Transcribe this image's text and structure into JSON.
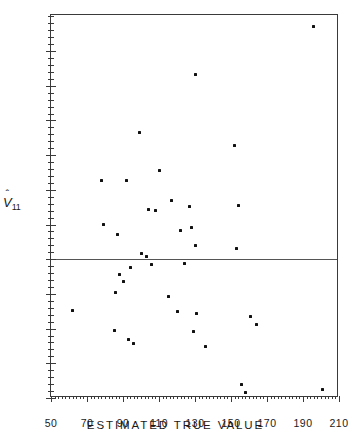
{
  "chart_data": {
    "type": "scatter",
    "title": "",
    "xlabel": "ESTIMATED TRUE VALUE",
    "ylabel": "V̀11",
    "ylabel_parts": {
      "symbol": "V",
      "accent": "ˆ",
      "subscript": "11"
    },
    "xlim": [
      50,
      210
    ],
    "ylim": [
      -10.0,
      17.6
    ],
    "xticks": [
      50,
      70,
      90,
      110,
      130,
      150,
      170,
      190,
      210
    ],
    "xtick_labels": [
      "50",
      "70",
      "90",
      "110",
      "130",
      "150",
      "170",
      "190",
      "210"
    ],
    "x_minor_step": 2,
    "yticks": [
      -10.0,
      -7.5,
      -5.0,
      -2.5,
      0,
      2.5,
      5.0,
      7.5,
      10.0,
      12.5,
      15.0
    ],
    "ytick_labels": [
      "-10.0",
      "-7.5",
      "-5.0",
      "-2.5",
      "0",
      "2.5",
      "5.0",
      "7.5",
      "10.0",
      "12.5",
      "15.0"
    ],
    "y_minor_step": 0.5,
    "grid": false,
    "legend": null,
    "reference_line": {
      "axis": "y",
      "value": 0
    },
    "marker": {
      "shape": "square",
      "color": "#111111",
      "size": 3
    },
    "points": [
      {
        "x": 62,
        "y": -3.7
      },
      {
        "x": 78,
        "y": 5.7
      },
      {
        "x": 79,
        "y": 2.5
      },
      {
        "x": 85,
        "y": -5.1
      },
      {
        "x": 86,
        "y": -2.4
      },
      {
        "x": 87,
        "y": 1.8
      },
      {
        "x": 88,
        "y": -1.1
      },
      {
        "x": 90,
        "y": -1.6
      },
      {
        "x": 92,
        "y": 5.7
      },
      {
        "x": 93,
        "y": -5.8
      },
      {
        "x": 94,
        "y": -0.6
      },
      {
        "x": 96,
        "y": -6.1
      },
      {
        "x": 99,
        "y": 9.1
      },
      {
        "x": 100,
        "y": 0.4
      },
      {
        "x": 103,
        "y": 0.2
      },
      {
        "x": 104,
        "y": 3.6
      },
      {
        "x": 106,
        "y": -0.4
      },
      {
        "x": 108,
        "y": 3.5
      },
      {
        "x": 110,
        "y": 6.4
      },
      {
        "x": 115,
        "y": -2.7
      },
      {
        "x": 117,
        "y": 4.2
      },
      {
        "x": 120,
        "y": -3.8
      },
      {
        "x": 122,
        "y": 2.1
      },
      {
        "x": 124,
        "y": -0.3
      },
      {
        "x": 127,
        "y": 3.8
      },
      {
        "x": 128,
        "y": 2.3
      },
      {
        "x": 129,
        "y": -5.2
      },
      {
        "x": 130,
        "y": 13.3
      },
      {
        "x": 130,
        "y": 1.0
      },
      {
        "x": 131,
        "y": -3.9
      },
      {
        "x": 136,
        "y": -6.3
      },
      {
        "x": 152,
        "y": 8.2
      },
      {
        "x": 153,
        "y": 0.8
      },
      {
        "x": 154,
        "y": 3.9
      },
      {
        "x": 156,
        "y": -9.0
      },
      {
        "x": 158,
        "y": -9.6
      },
      {
        "x": 161,
        "y": -4.1
      },
      {
        "x": 164,
        "y": -4.7
      },
      {
        "x": 196,
        "y": 16.8
      },
      {
        "x": 201,
        "y": -9.4
      }
    ]
  }
}
